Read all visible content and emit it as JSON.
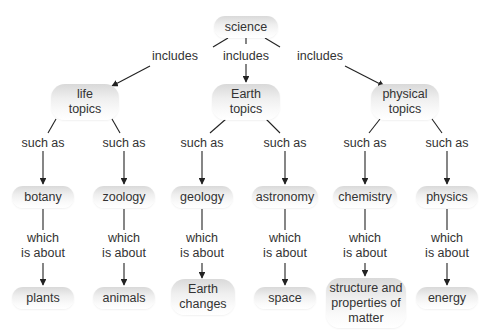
{
  "diagram": {
    "type": "concept-map",
    "root": {
      "id": "science",
      "label": "science"
    },
    "nodes": [
      {
        "id": "science",
        "label": "science",
        "x": 246,
        "y": 27,
        "w": 64,
        "h": 22
      },
      {
        "id": "life",
        "label": "life\ntopics",
        "x": 85,
        "y": 102,
        "w": 68,
        "h": 36
      },
      {
        "id": "earth",
        "label": "Earth\ntopics",
        "x": 246,
        "y": 102,
        "w": 68,
        "h": 36
      },
      {
        "id": "physical",
        "label": "physical\ntopics",
        "x": 405,
        "y": 102,
        "w": 68,
        "h": 36
      },
      {
        "id": "botany",
        "label": "botany",
        "x": 43,
        "y": 197,
        "w": 62,
        "h": 22
      },
      {
        "id": "zoology",
        "label": "zoology",
        "x": 124,
        "y": 197,
        "w": 62,
        "h": 22
      },
      {
        "id": "geology",
        "label": "geology",
        "x": 202,
        "y": 197,
        "w": 62,
        "h": 22
      },
      {
        "id": "astronomy",
        "label": "astronomy",
        "x": 285,
        "y": 197,
        "w": 66,
        "h": 22
      },
      {
        "id": "chemistry",
        "label": "chemistry",
        "x": 365,
        "y": 197,
        "w": 64,
        "h": 22
      },
      {
        "id": "physics",
        "label": "physics",
        "x": 447,
        "y": 197,
        "w": 62,
        "h": 22
      },
      {
        "id": "plants",
        "label": "plants",
        "x": 43,
        "y": 298,
        "w": 62,
        "h": 22
      },
      {
        "id": "animals",
        "label": "animals",
        "x": 124,
        "y": 298,
        "w": 62,
        "h": 22
      },
      {
        "id": "earth_changes",
        "label": "Earth\nchanges",
        "x": 203,
        "y": 297,
        "w": 64,
        "h": 36
      },
      {
        "id": "space",
        "label": "space",
        "x": 285,
        "y": 298,
        "w": 62,
        "h": 22
      },
      {
        "id": "matter",
        "label": "structure and\nproperties of\nmatter",
        "x": 366,
        "y": 303,
        "w": 80,
        "h": 50
      },
      {
        "id": "energy",
        "label": "energy",
        "x": 447,
        "y": 298,
        "w": 62,
        "h": 22
      }
    ],
    "links": [
      {
        "id": "l1",
        "label": "includes",
        "from": "science",
        "to": "life",
        "lx": 175,
        "ly": 56
      },
      {
        "id": "l2",
        "label": "includes",
        "from": "science",
        "to": "earth",
        "lx": 246,
        "ly": 56
      },
      {
        "id": "l3",
        "label": "includes",
        "from": "science",
        "to": "physical",
        "lx": 320,
        "ly": 56
      },
      {
        "id": "l4",
        "label": "such as",
        "from": "life",
        "to": "botany",
        "lx": 43,
        "ly": 143
      },
      {
        "id": "l5",
        "label": "such as",
        "from": "life",
        "to": "zoology",
        "lx": 124,
        "ly": 143
      },
      {
        "id": "l6",
        "label": "such as",
        "from": "earth",
        "to": "geology",
        "lx": 202,
        "ly": 143
      },
      {
        "id": "l7",
        "label": "such as",
        "from": "earth",
        "to": "astronomy",
        "lx": 285,
        "ly": 143
      },
      {
        "id": "l8",
        "label": "such as",
        "from": "physical",
        "to": "chemistry",
        "lx": 365,
        "ly": 143
      },
      {
        "id": "l9",
        "label": "such as",
        "from": "physical",
        "to": "physics",
        "lx": 447,
        "ly": 143
      },
      {
        "id": "l10",
        "label": "which\nis about",
        "from": "botany",
        "to": "plants",
        "lx": 43,
        "ly": 246
      },
      {
        "id": "l11",
        "label": "which\nis about",
        "from": "zoology",
        "to": "animals",
        "lx": 124,
        "ly": 246
      },
      {
        "id": "l12",
        "label": "which\nis about",
        "from": "geology",
        "to": "earth_changes",
        "lx": 202,
        "ly": 246
      },
      {
        "id": "l13",
        "label": "which\nis about",
        "from": "astronomy",
        "to": "space",
        "lx": 285,
        "ly": 246
      },
      {
        "id": "l14",
        "label": "which\nis about",
        "from": "chemistry",
        "to": "matter",
        "lx": 365,
        "ly": 246
      },
      {
        "id": "l15",
        "label": "which\nis about",
        "from": "physics",
        "to": "energy",
        "lx": 447,
        "ly": 246
      }
    ],
    "edges": [
      {
        "segments": [
          [
            228,
            38,
            213,
            47
          ],
          [
            150,
            66,
            112,
            86
          ]
        ],
        "arrow": [
          112,
          86
        ]
      },
      {
        "segments": [
          [
            246,
            38,
            246,
            44
          ],
          [
            246,
            64,
            246,
            82
          ]
        ],
        "arrow": [
          246,
          82
        ]
      },
      {
        "segments": [
          [
            265,
            38,
            280,
            47
          ],
          [
            345,
            66,
            384,
            86
          ]
        ],
        "arrow": [
          384,
          86
        ]
      },
      {
        "segments": [
          [
            56,
            119,
            48,
            133
          ],
          [
            43,
            151,
            43,
            184
          ]
        ],
        "arrow": [
          43,
          184
        ]
      },
      {
        "segments": [
          [
            112,
            119,
            120,
            133
          ],
          [
            124,
            151,
            124,
            184
          ]
        ],
        "arrow": [
          124,
          184
        ]
      },
      {
        "segments": [
          [
            226,
            119,
            210,
            133
          ],
          [
            202,
            151,
            202,
            184
          ]
        ],
        "arrow": [
          202,
          184
        ]
      },
      {
        "segments": [
          [
            266,
            119,
            280,
            133
          ],
          [
            285,
            151,
            285,
            184
          ]
        ],
        "arrow": [
          285,
          184
        ]
      },
      {
        "segments": [
          [
            380,
            119,
            369,
            133
          ],
          [
            365,
            151,
            365,
            184
          ]
        ],
        "arrow": [
          365,
          184
        ]
      },
      {
        "segments": [
          [
            432,
            119,
            442,
            133
          ],
          [
            447,
            151,
            447,
            184
          ]
        ],
        "arrow": [
          447,
          184
        ]
      },
      {
        "segments": [
          [
            43,
            209,
            43,
            230
          ],
          [
            43,
            263,
            43,
            285
          ]
        ],
        "arrow": [
          43,
          285
        ]
      },
      {
        "segments": [
          [
            124,
            209,
            124,
            230
          ],
          [
            124,
            263,
            124,
            285
          ]
        ],
        "arrow": [
          124,
          285
        ]
      },
      {
        "segments": [
          [
            202,
            209,
            202,
            230
          ],
          [
            202,
            263,
            202,
            278
          ]
        ],
        "arrow": [
          202,
          278
        ]
      },
      {
        "segments": [
          [
            285,
            209,
            285,
            230
          ],
          [
            285,
            263,
            285,
            285
          ]
        ],
        "arrow": [
          285,
          285
        ]
      },
      {
        "segments": [
          [
            365,
            209,
            365,
            230
          ],
          [
            365,
            263,
            365,
            276
          ]
        ],
        "arrow": [
          365,
          276
        ]
      },
      {
        "segments": [
          [
            447,
            209,
            447,
            230
          ],
          [
            447,
            263,
            447,
            285
          ]
        ],
        "arrow": [
          447,
          285
        ]
      }
    ],
    "colors": {
      "line": "#222222",
      "text": "#333333",
      "node_gradient_top": "#d9d9d9",
      "node_gradient_bottom": "#ffffff",
      "background": "#ffffff"
    }
  }
}
